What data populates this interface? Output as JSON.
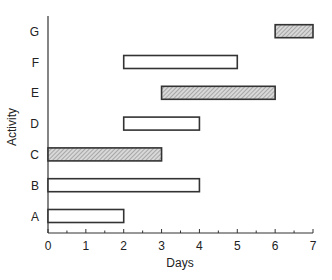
{
  "chart_data": {
    "type": "gantt",
    "title": "",
    "xlabel": "Days",
    "ylabel": "Activity",
    "xlim": [
      0,
      7
    ],
    "xticks": [
      0,
      1,
      2,
      3,
      4,
      5,
      6,
      7
    ],
    "grid": false,
    "legend": null,
    "categories": [
      "A",
      "B",
      "C",
      "D",
      "E",
      "F",
      "G"
    ],
    "tasks": [
      {
        "activity": "A",
        "start": 0,
        "end": 2,
        "critical": false
      },
      {
        "activity": "B",
        "start": 0,
        "end": 4,
        "critical": false
      },
      {
        "activity": "C",
        "start": 0,
        "end": 3,
        "critical": true
      },
      {
        "activity": "D",
        "start": 2,
        "end": 4,
        "critical": false
      },
      {
        "activity": "E",
        "start": 3,
        "end": 6,
        "critical": true
      },
      {
        "activity": "F",
        "start": 2,
        "end": 5,
        "critical": false
      },
      {
        "activity": "G",
        "start": 6,
        "end": 7,
        "critical": true
      }
    ],
    "styles": {
      "critical_fill": "hatched-gray",
      "normal_fill": "#ffffff",
      "outline": "#333333"
    }
  }
}
